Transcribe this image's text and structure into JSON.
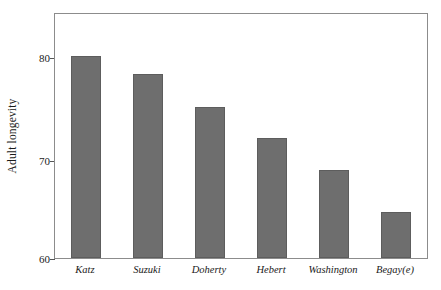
{
  "chart_data": {
    "type": "bar",
    "title": "",
    "xlabel": "",
    "ylabel": "Adult longevity",
    "categories": [
      "Katz",
      "Suzuki",
      "Doherty",
      "Hebert",
      "Washington",
      "Begay(e)"
    ],
    "values": [
      80.2,
      78.4,
      75.1,
      72.0,
      68.8,
      64.6
    ],
    "ylim": [
      60,
      84.4
    ],
    "yticks": [
      60,
      70,
      80
    ],
    "ytick_labels": [
      "60",
      "70",
      "80"
    ],
    "grid": false,
    "legend": null,
    "bar_color": "#6e6e6e",
    "bar_edge_color": "#5d5d5d",
    "frame_color": "#8c8c8c",
    "background": "#ffffff"
  },
  "axes": {
    "y_title": "Adult longevity",
    "tick_0": "60",
    "tick_1": "70",
    "tick_2": "80"
  },
  "categories": {
    "c0": "Katz",
    "c1": "Suzuki",
    "c2": "Doherty",
    "c3": "Hebert",
    "c4": "Washington",
    "c5": "Begay(e)"
  }
}
